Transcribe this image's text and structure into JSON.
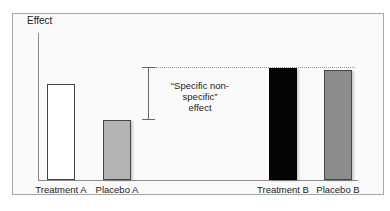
{
  "chart_data": {
    "type": "bar",
    "title": "",
    "xlabel": "",
    "ylabel": "Effect",
    "categories": [
      "Treatment A",
      "Placebo A",
      "Treatment B",
      "Placebo B"
    ],
    "values": [
      65,
      41,
      76,
      75
    ],
    "bar_colors": [
      "#ffffff",
      "#b3b3b3",
      "#050505",
      "#8c8c8c"
    ],
    "ylim": [
      0,
      100
    ],
    "grid": false,
    "legend": null,
    "annotations": [
      {
        "type": "bracket",
        "text_line1": "“Specific non-specific”",
        "text_line2": "effect",
        "from_value": 41,
        "to_value": 76,
        "reference_line": "dotted line at Treatment B height"
      }
    ]
  },
  "labels": {
    "ylabel": "Effect",
    "annot_line1": "“Specific non-specific”",
    "annot_line2": "effect",
    "bars": [
      "Treatment A",
      "Placebo A",
      "Treatment B",
      "Placebo B"
    ]
  }
}
